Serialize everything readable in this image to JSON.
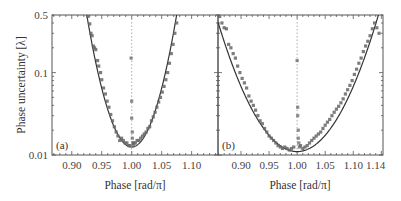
{
  "chart_data": [
    {
      "type": "scatter",
      "panel_label": "(a)",
      "xlabel": "Phase [rad/π]",
      "ylabel": "Phase uncertainty [λ]",
      "xlim": [
        0.867,
        1.144
      ],
      "ylim": [
        0.01,
        0.5
      ],
      "yscale": "log",
      "xticks": [
        0.9,
        0.95,
        1.0,
        1.05,
        1.1
      ],
      "xtick_labels": [
        "0.90",
        "0.95",
        "1.00",
        "1.05",
        "1.10"
      ],
      "yticks": [
        0.01,
        0.1,
        0.5
      ],
      "ytick_labels": [
        "0.01",
        "0.1",
        "0.5"
      ],
      "vertical_line_x": 1.0,
      "fit": {
        "form": "log10(u) = log10(umin) + k*(x - 1)^2",
        "umin": 0.0125,
        "k": 285
      },
      "series": [
        {
          "name": "measured",
          "x": [
            0.927,
            0.93,
            0.932,
            0.934,
            0.936,
            0.938,
            0.94,
            0.943,
            0.945,
            0.948,
            0.95,
            0.953,
            0.956,
            0.959,
            0.962,
            0.965,
            0.968,
            0.971,
            0.974,
            0.977,
            0.98,
            0.983,
            0.986,
            0.989,
            0.992,
            0.995,
            0.997,
            1.003,
            1.006,
            1.009,
            1.012,
            1.015,
            1.018,
            1.021,
            1.024,
            1.027,
            1.03,
            1.033,
            1.036,
            1.039,
            1.042,
            1.045,
            1.048,
            1.051,
            1.054,
            1.057,
            1.06,
            1.063,
            1.066,
            1.069,
            1.072,
            1.075
          ],
          "y": [
            0.48,
            0.39,
            0.3,
            0.28,
            0.21,
            0.2,
            0.19,
            0.14,
            0.12,
            0.1,
            0.082,
            0.065,
            0.055,
            0.045,
            0.038,
            0.031,
            0.026,
            0.022,
            0.019,
            0.017,
            0.015,
            0.016,
            0.015,
            0.014,
            0.014,
            0.013,
            0.013,
            0.014,
            0.014,
            0.015,
            0.015,
            0.016,
            0.017,
            0.018,
            0.019,
            0.021,
            0.022,
            0.026,
            0.029,
            0.033,
            0.038,
            0.044,
            0.05,
            0.058,
            0.068,
            0.082,
            0.1,
            0.13,
            0.17,
            0.22,
            0.3,
            0.4
          ]
        },
        {
          "name": "near-pi points",
          "x": [
            0.999,
            1.0,
            1.0,
            1.001,
            1.001,
            1.002,
            1.003
          ],
          "y": [
            0.15,
            0.045,
            0.028,
            0.019,
            0.016,
            0.014,
            0.013
          ]
        }
      ]
    },
    {
      "type": "scatter",
      "panel_label": "(b)",
      "xlabel": "Phase [rad/π]",
      "ylabel": "Phase uncertainty [λ]",
      "xlim": [
        0.859,
        1.153
      ],
      "ylim": [
        0.01,
        0.5
      ],
      "yscale": "log",
      "xticks": [
        0.9,
        0.95,
        1.0,
        1.05,
        1.1,
        1.14
      ],
      "xtick_labels": [
        "0.90",
        "0.95",
        "1.00",
        "1.05",
        "1.10",
        "1.14"
      ],
      "yticks": [
        0.01,
        0.1,
        0.5
      ],
      "ytick_labels": [
        "0.01",
        "0.1",
        "0.5"
      ],
      "vertical_line_x": 1.0,
      "fit": {
        "form": "log10(u) = log10(umin) + k*(x - 1)^2",
        "umin": 0.011,
        "k": 79
      },
      "series": [
        {
          "name": "measured",
          "x": [
            0.862,
            0.866,
            0.87,
            0.874,
            0.878,
            0.882,
            0.886,
            0.89,
            0.894,
            0.898,
            0.902,
            0.906,
            0.91,
            0.914,
            0.918,
            0.922,
            0.926,
            0.93,
            0.934,
            0.938,
            0.942,
            0.946,
            0.95,
            0.954,
            0.958,
            0.962,
            0.966,
            0.97,
            0.974,
            0.978,
            0.982,
            0.986,
            0.99,
            0.994,
            1.006,
            1.01,
            1.014,
            1.018,
            1.022,
            1.026,
            1.03,
            1.034,
            1.038,
            1.042,
            1.046,
            1.05,
            1.054,
            1.058,
            1.062,
            1.066,
            1.07,
            1.074,
            1.078,
            1.082,
            1.086,
            1.09,
            1.094,
            1.098,
            1.102,
            1.106,
            1.11,
            1.114,
            1.118,
            1.122,
            1.126,
            1.13,
            1.134,
            1.138,
            1.142,
            1.146
          ],
          "y": [
            0.48,
            0.4,
            0.35,
            0.34,
            0.22,
            0.2,
            0.17,
            0.15,
            0.12,
            0.1,
            0.085,
            0.075,
            0.065,
            0.052,
            0.045,
            0.04,
            0.035,
            0.03,
            0.026,
            0.024,
            0.021,
            0.019,
            0.017,
            0.016,
            0.015,
            0.014,
            0.013,
            0.0125,
            0.012,
            0.0125,
            0.012,
            0.0115,
            0.012,
            0.0125,
            0.013,
            0.012,
            0.0125,
            0.013,
            0.014,
            0.015,
            0.016,
            0.017,
            0.018,
            0.019,
            0.021,
            0.023,
            0.025,
            0.027,
            0.03,
            0.033,
            0.036,
            0.039,
            0.043,
            0.048,
            0.055,
            0.062,
            0.07,
            0.08,
            0.095,
            0.11,
            0.13,
            0.15,
            0.18,
            0.21,
            0.24,
            0.28,
            0.34,
            0.4,
            0.35,
            0.3
          ]
        },
        {
          "name": "near-pi points",
          "x": [
            1.0,
            1.001,
            1.001,
            1.002,
            1.002,
            1.003,
            1.004
          ],
          "y": [
            0.14,
            0.038,
            0.03,
            0.02,
            0.016,
            0.014,
            0.0125
          ]
        }
      ]
    }
  ],
  "figure": {
    "panels": [
      {
        "tag": "(a)",
        "xlabel": "Phase [rad/π]"
      },
      {
        "tag": "(b)",
        "xlabel": "Phase [rad/π]"
      }
    ],
    "ylabel": "Phase uncertainty [λ]",
    "colors": {
      "axis": "#555555",
      "fit": "#333333",
      "marker": "#666666",
      "dashed": "#888888"
    }
  }
}
